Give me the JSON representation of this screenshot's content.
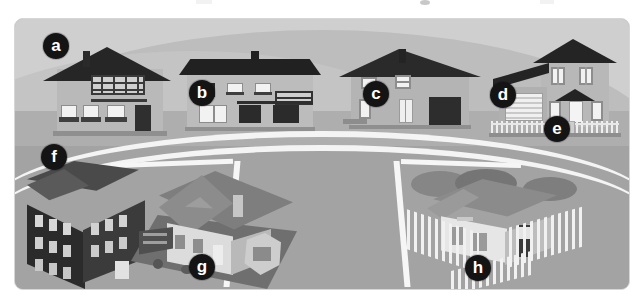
{
  "figure": {
    "kind": "neighborhood-housing-illustration",
    "panel": {
      "border_color": "#d6d6d6",
      "sky_color": "#cfcfcf",
      "ground_color": "#a3a3a3",
      "road_line_color": "#f4f4f4"
    }
  },
  "markers": [
    {
      "id": "a",
      "label": "a",
      "target": "detached-house-with-balcony",
      "row": "upper",
      "x": 40,
      "y": 28
    },
    {
      "id": "b",
      "label": "b",
      "target": "wide-flat-roof-house",
      "row": "upper",
      "x": 185,
      "y": 76
    },
    {
      "id": "c",
      "label": "c",
      "target": "gabled-house-with-garage",
      "row": "upper",
      "x": 358,
      "y": 76
    },
    {
      "id": "d",
      "label": "d",
      "target": "house-garage-door",
      "row": "upper",
      "x": 487,
      "y": 78
    },
    {
      "id": "e",
      "label": "e",
      "target": "front-fence-and-steps",
      "row": "upper",
      "x": 541,
      "y": 110
    },
    {
      "id": "f",
      "label": "f",
      "target": "multi-storey-apartment-block",
      "row": "lower",
      "x": 38,
      "y": 140
    },
    {
      "id": "g",
      "label": "g",
      "target": "suburban-house-with-garden",
      "row": "lower",
      "x": 186,
      "y": 250
    },
    {
      "id": "h",
      "label": "h",
      "target": "bungalow-with-picket-fence",
      "row": "lower",
      "x": 462,
      "y": 251
    }
  ],
  "buildings": {
    "upper_row": [
      {
        "id": "house-a",
        "name": "Detached house with balcony",
        "marker": "a",
        "features": [
          "steep dark gable roof",
          "chimney",
          "first-floor balcony with railing",
          "three ground-floor windows with awnings",
          "dark entrance door"
        ]
      },
      {
        "id": "house-b",
        "name": "Wide flat-roof house",
        "marker": "b",
        "features": [
          "low-pitch dark roof",
          "central chimney",
          "row of upper windows",
          "dark shuttered ground-floor windows",
          "horizontal railing"
        ]
      },
      {
        "id": "house-c",
        "name": "Gabled house with garage",
        "marker": "c",
        "features": [
          "pitched roof",
          "chimney",
          "white upper windows",
          "panelled front door",
          "dark garage door"
        ]
      },
      {
        "id": "house-d",
        "name": "Two-storey house with garage wing",
        "marker": "d",
        "features": [
          "dark gable roof",
          "attached garage with striped door",
          "porch canopy",
          "paired upper windows",
          "white picket fence"
        ]
      }
    ],
    "lower_row": [
      {
        "id": "building-f",
        "name": "Multi-storey apartment block",
        "marker": "f",
        "features": [
          "three storeys",
          "dark facade",
          "many rectangular windows",
          "hipped dark roof",
          "ground-floor entrance"
        ]
      },
      {
        "id": "house-g",
        "name": "Suburban house with garden",
        "marker": "g",
        "features": [
          "large pitched roof",
          "roof dormer",
          "chimney",
          "bay window",
          "front garden with pergola",
          "paved plot"
        ]
      },
      {
        "id": "house-h",
        "name": "Bungalow with picket fence",
        "marker": "h",
        "features": [
          "single storey",
          "hipped roof",
          "two front windows",
          "side entrance door",
          "white picket fence",
          "trees behind"
        ]
      }
    ]
  }
}
